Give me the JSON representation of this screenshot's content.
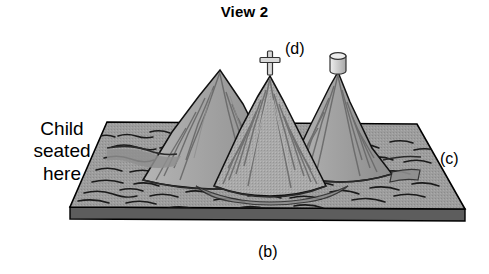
{
  "figure": {
    "title": "View 2",
    "type": "terrain-model-diagram",
    "description_labels": {
      "child_note": "Child\nseated\nhere",
      "side_a": "(a)",
      "side_b": "(b)",
      "side_c": "(c)",
      "landmark_d": "(d)"
    },
    "landmarks": {
      "cross_icon": "cross-marker-icon",
      "cylinder_icon": "cylinder-marker-icon"
    },
    "mountains": [
      {
        "name": "left-mountain",
        "peak_x": 220,
        "peak_y": 70
      },
      {
        "name": "center-mountain",
        "peak_x": 270,
        "peak_y": 76
      },
      {
        "name": "right-mountain",
        "peak_x": 338,
        "peak_y": 72
      }
    ],
    "colors": {
      "ink": "#000000",
      "ground_top": "#9a9a9a",
      "ground_edge": "#6f6f6f",
      "ground_side": "#5f5f5f",
      "mountain_light": "#b2b2b2",
      "mountain_mid": "#9d9d9d",
      "mountain_dark": "#7e7e7e",
      "marker_fill": "#d8d8d8",
      "background": "#ffffff"
    }
  }
}
